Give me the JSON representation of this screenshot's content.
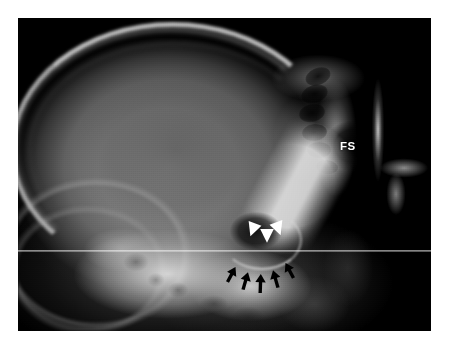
{
  "figure": {
    "modality": "lateral skull radiograph",
    "plate": {
      "left": 18,
      "top": 18,
      "width": 413,
      "height": 313,
      "background_color": "#000000",
      "page_background_color": "#ffffff"
    },
    "artifacts": {
      "scan_line": {
        "label": "horizontal-scan-line",
        "y": 232,
        "color": "#ffffff"
      }
    }
  },
  "annotations": {
    "text_labels": [
      {
        "id": "fs",
        "text": "FS",
        "meaning": "frontal sinus",
        "color": "#ffffff",
        "x": 322,
        "y": 122,
        "font_size": 11.5,
        "bold": true
      }
    ],
    "arrowheads": {
      "label": "white-arrowheads",
      "color": "#ffffff",
      "count": 3,
      "meaning": "margins of the enlarged sella turcica",
      "items": [
        {
          "id": "arrowhead-left",
          "x": 224,
          "y": 200,
          "size": 11,
          "rotation": 200
        },
        {
          "id": "arrowhead-middle",
          "x": 238,
          "y": 206,
          "size": 11,
          "rotation": 180
        },
        {
          "id": "arrowhead-right",
          "x": 249,
          "y": 199,
          "size": 11,
          "rotation": 160
        }
      ]
    },
    "arrows": {
      "label": "black-arrows",
      "color": "#000000",
      "count": 5,
      "meaning": "expanded floor of the sella / skull base erosion",
      "items": [
        {
          "id": "arrow-1",
          "x": 207,
          "y": 248,
          "length": 17,
          "rotation": 28
        },
        {
          "id": "arrow-2",
          "x": 221,
          "y": 254,
          "length": 18,
          "rotation": 16
        },
        {
          "id": "arrow-3",
          "x": 236,
          "y": 256,
          "length": 19,
          "rotation": 2
        },
        {
          "id": "arrow-4",
          "x": 251,
          "y": 252,
          "length": 18,
          "rotation": -16
        },
        {
          "id": "arrow-5",
          "x": 265,
          "y": 244,
          "length": 17,
          "rotation": -28
        }
      ]
    }
  },
  "anatomy": {
    "regions": [
      {
        "id": "cranial-vault",
        "label": "cranial vault"
      },
      {
        "id": "frontal-sinus",
        "label": "frontal sinus"
      },
      {
        "id": "ethmoid-cells",
        "label": "ethmoid air cells"
      },
      {
        "id": "sella-lesion",
        "label": "enlarged sella turcica"
      },
      {
        "id": "skull-base",
        "label": "petrous bone and skull base"
      },
      {
        "id": "occipital",
        "label": "occipital region"
      },
      {
        "id": "mandible",
        "label": "mandibular ramus"
      }
    ],
    "air_cells": [
      {
        "x": 300,
        "y": 58,
        "w": 26,
        "h": 17,
        "r": -22
      },
      {
        "x": 296,
        "y": 76,
        "w": 27,
        "h": 18,
        "r": -18
      },
      {
        "x": 294,
        "y": 95,
        "w": 26,
        "h": 18,
        "r": -12
      },
      {
        "x": 296,
        "y": 114,
        "w": 25,
        "h": 17,
        "r": -6
      },
      {
        "x": 301,
        "y": 132,
        "w": 24,
        "h": 16,
        "r": 0
      },
      {
        "x": 309,
        "y": 149,
        "w": 22,
        "h": 14,
        "r": 6
      }
    ]
  }
}
